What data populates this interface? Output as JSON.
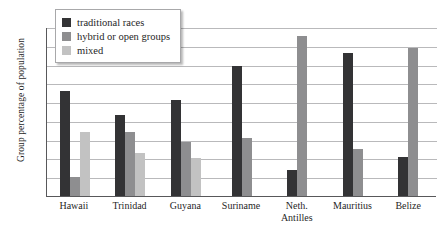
{
  "chart_data": {
    "type": "bar",
    "title": "",
    "xlabel": "",
    "ylabel": "Group percentage of population",
    "ylim": [
      0,
      90
    ],
    "yticks": [
      0,
      10,
      20,
      30,
      40,
      50,
      60,
      70,
      80,
      90
    ],
    "grid": true,
    "legend_position": "top-left",
    "categories": [
      "Hawaii",
      "Trinidad",
      "Guyana",
      "Suriname",
      "Neth. Antilles",
      "Mauritius",
      "Belize"
    ],
    "category_lines": [
      [
        "Hawaii"
      ],
      [
        "Trinidad"
      ],
      [
        "Guyana"
      ],
      [
        "Suriname"
      ],
      [
        "Neth.",
        "Antilles"
      ],
      [
        "Mauritius"
      ],
      [
        "Belize"
      ]
    ],
    "series": [
      {
        "name": "traditional races",
        "color": "#333335",
        "values": [
          56,
          43,
          51,
          69,
          14,
          76,
          21
        ]
      },
      {
        "name": "hybrid or open groups",
        "color": "#8e8e90",
        "values": [
          10,
          34,
          29,
          31,
          85,
          25,
          79
        ]
      },
      {
        "name": "mixed",
        "color": "#c2c2c2",
        "values": [
          34,
          23,
          20,
          null,
          null,
          null,
          null
        ]
      }
    ]
  },
  "legend": {
    "items": [
      {
        "label": "traditional races"
      },
      {
        "label": "hybrid or open groups"
      },
      {
        "label": "mixed"
      }
    ]
  },
  "colors": {
    "traditional": "#333335",
    "hybrid": "#8e8e90",
    "mixed": "#c2c2c2",
    "axis": "#58585a",
    "gridline": "#b9b9bb",
    "background": "#ffffff"
  }
}
